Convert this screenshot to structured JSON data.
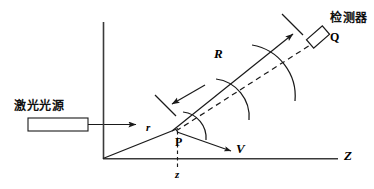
{
  "figure": {
    "type": "optics-scattering-geometry-diagram",
    "background_color": "#ffffff",
    "line_color": "#1a1a1a",
    "title": "",
    "labels": {
      "laser_source": "激光光源",
      "detector": "检测器",
      "detector_point": "Q",
      "scatter_point": "P",
      "distance_source_to_point": "r",
      "distance_point_to_detector": "R",
      "velocity_vector": "V",
      "depth_coordinate": "z",
      "axis_horizontal": "Z"
    },
    "elements": {
      "laser_box": {
        "x": 28,
        "y": 118,
        "width": 60,
        "height": 13
      },
      "beam_arrow": {
        "x1": 88,
        "y1": 124,
        "x2": 137,
        "y2": 124
      },
      "vertical_axis": {
        "x": 103,
        "y1": 22,
        "y2": 159
      },
      "horizontal_axis": {
        "x1": 103,
        "y1": 159,
        "x2": 338,
        "y2": 159
      },
      "incident_ray": {
        "x1": 103,
        "y1": 159,
        "x2": 177,
        "y2": 128
      },
      "scattered_ray": {
        "x1": 173,
        "y1": 130,
        "x2": 296,
        "y2": 32
      },
      "dashed_ray": {
        "x1": 174,
        "y1": 131,
        "x2": 320,
        "y2": 37
      },
      "dashed_depth": {
        "x": 177,
        "y1": 131,
        "y2": 165
      },
      "velocity_arrow": {
        "x1": 176,
        "y1": 132,
        "x2": 232,
        "y2": 152
      },
      "detector_box": {
        "cx": 319,
        "cy": 36,
        "w": 18,
        "h": 10,
        "rotation": -40
      },
      "wavefront_arcs": 3,
      "aperture_marks": 2
    }
  }
}
